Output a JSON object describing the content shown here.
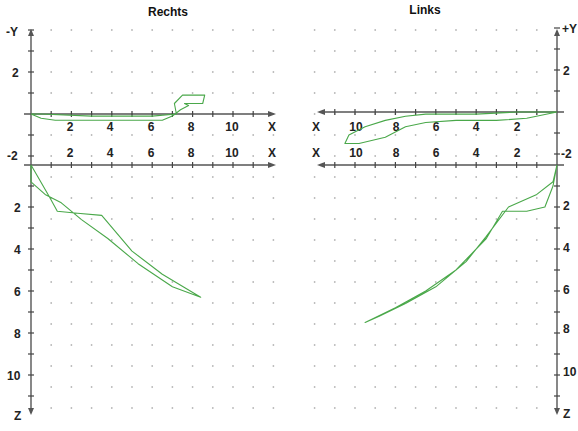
{
  "chart_data": [
    {
      "type": "line",
      "title": "Rechts",
      "panel": "top-left",
      "plane": "X-Y",
      "xlabel": "X",
      "ylabel": "-Y",
      "x_ticks": [
        2,
        4,
        6,
        8,
        10
      ],
      "y_ticks": [
        2,
        -2
      ],
      "xlim": [
        0,
        12
      ],
      "ylim": [
        -2.3,
        3
      ],
      "grid": "dotted",
      "series": [
        {
          "name": "trace",
          "x": [
            0,
            0.5,
            1.2,
            3,
            5,
            6.5,
            7,
            7.4,
            7.8,
            7.6,
            8.5,
            8.6,
            7.5,
            7.1,
            7.2,
            6,
            3,
            0.5,
            0
          ],
          "y": [
            0,
            -0.2,
            -0.3,
            -0.3,
            -0.3,
            -0.3,
            -0.1,
            0.2,
            0.4,
            0.5,
            0.5,
            0.9,
            0.9,
            0.5,
            0.0,
            -0.1,
            -0.1,
            0,
            0
          ]
        }
      ]
    },
    {
      "type": "line",
      "title": "Links",
      "panel": "top-right",
      "plane": "X-Y",
      "xlabel": "X",
      "ylabel": "+Y",
      "x_ticks": [
        10,
        8,
        6,
        4,
        2
      ],
      "y_ticks": [
        2,
        -2
      ],
      "x_direction": "reversed",
      "xlim": [
        12,
        0
      ],
      "ylim": [
        -2.3,
        3
      ],
      "grid": "dotted",
      "series": [
        {
          "name": "trace",
          "x": [
            0,
            1.5,
            3,
            5,
            6.5,
            7.5,
            8.5,
            9.8,
            10.5,
            10.3,
            9.5,
            8.5,
            7.5,
            6.5,
            4,
            2,
            0
          ],
          "y": [
            0,
            -0.3,
            -0.4,
            -0.4,
            -0.5,
            -0.7,
            -1.2,
            -1.5,
            -1.5,
            -1.1,
            -0.7,
            -0.4,
            -0.2,
            -0.1,
            -0.1,
            0,
            0
          ]
        }
      ]
    },
    {
      "type": "line",
      "title": "Rechts",
      "panel": "bottom-left",
      "plane": "X-Z",
      "xlabel": "X",
      "ylabel": "Z",
      "y_ticks": [
        2,
        4,
        6,
        8,
        10
      ],
      "ylim": [
        0,
        12
      ],
      "xlim": [
        0,
        12
      ],
      "grid": "dotted",
      "series": [
        {
          "name": "trace",
          "x": [
            0,
            0.3,
            0.9,
            1.3,
            2.3,
            3.5,
            5,
            6.5,
            8.4,
            7,
            5.3,
            3.8,
            2.5,
            1.5,
            0.7,
            0,
            0
          ],
          "y": [
            0,
            0.5,
            1.5,
            2.2,
            2.3,
            2.4,
            4.1,
            5.2,
            6.3,
            5.8,
            4.7,
            3.5,
            2.6,
            1.8,
            1.4,
            0.8,
            0
          ]
        }
      ]
    },
    {
      "type": "line",
      "title": "Links",
      "panel": "bottom-right",
      "plane": "X-Z",
      "xlabel": "X",
      "ylabel": "Z",
      "y_ticks": [
        2,
        4,
        6,
        8,
        10
      ],
      "x_direction": "reversed",
      "ylim": [
        0,
        12
      ],
      "xlim": [
        12,
        0
      ],
      "grid": "dotted",
      "series": [
        {
          "name": "trace",
          "x": [
            0,
            0.2,
            0.6,
            1.5,
            2.7,
            3.5,
            5,
            6.5,
            8,
            9.5,
            8.8,
            7.5,
            6,
            4.5,
            3.5,
            2.4,
            1.0,
            0.2,
            0
          ],
          "y": [
            0,
            1.0,
            2.0,
            2.2,
            2.2,
            3.5,
            5.0,
            6.0,
            6.8,
            7.5,
            7.2,
            6.6,
            5.8,
            4.6,
            3.4,
            2.0,
            1.4,
            0.8,
            0
          ]
        }
      ]
    }
  ],
  "titles": {
    "left": "Rechts",
    "right": "Links"
  },
  "axis_names": {
    "left_top_y": "-Y",
    "right_top_y": "+Y",
    "x": "X",
    "z": "Z"
  },
  "tick_labels": {
    "left_x": [
      "2",
      "4",
      "6",
      "8",
      "10"
    ],
    "right_x": [
      "10",
      "8",
      "6",
      "4",
      "2"
    ],
    "y_pos": "2",
    "y_neg": "-2",
    "z": [
      "2",
      "4",
      "6",
      "8",
      "10"
    ]
  }
}
